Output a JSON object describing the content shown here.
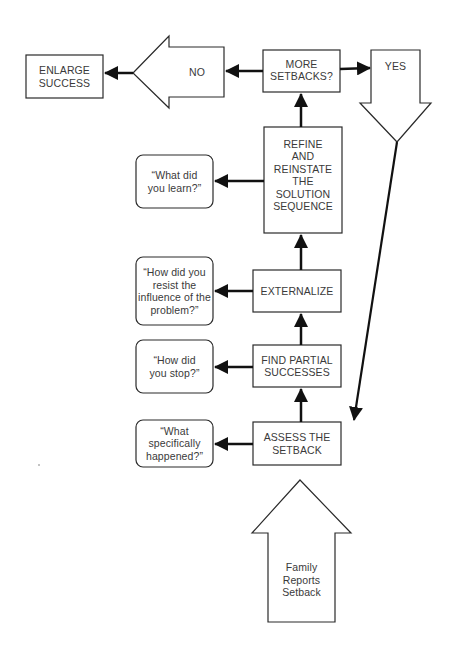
{
  "diagram": {
    "type": "flowchart",
    "nodes": {
      "family_reports": {
        "label": "Family\nReports\nSetback",
        "shape": "up-arrow"
      },
      "assess": {
        "label": "ASSESS THE\nSETBACK",
        "shape": "rectangle"
      },
      "assess_q": {
        "label": "“What\nspecifically\nhappened?”",
        "shape": "rounded-rectangle"
      },
      "find_partial": {
        "label": "FIND PARTIAL\nSUCCESSES",
        "shape": "rectangle"
      },
      "find_partial_q": {
        "label": "“How did\nyou stop?”",
        "shape": "rounded-rectangle"
      },
      "externalize": {
        "label": "EXTERNALIZE",
        "shape": "rectangle"
      },
      "externalize_q": {
        "label": "“How did you\nresist the\ninfluence of the\nproblem?”",
        "shape": "rounded-rectangle"
      },
      "refine": {
        "label": "REFINE\nAND\nREINSTATE\nTHE\nSOLUTION\nSEQUENCE",
        "shape": "rectangle"
      },
      "refine_q": {
        "label": "“What did\nyou learn?”",
        "shape": "rounded-rectangle"
      },
      "more_setbacks": {
        "label": "MORE\nSETBACKS?",
        "shape": "rectangle"
      },
      "yes": {
        "label": "YES",
        "shape": "down-arrow"
      },
      "no": {
        "label": "NO",
        "shape": "left-arrow"
      },
      "enlarge": {
        "label": "ENLARGE\nSUCCESS",
        "shape": "rectangle"
      }
    },
    "edges": [
      {
        "from": "family_reports",
        "to": "assess"
      },
      {
        "from": "assess",
        "to": "assess_q"
      },
      {
        "from": "assess",
        "to": "find_partial"
      },
      {
        "from": "find_partial",
        "to": "find_partial_q"
      },
      {
        "from": "find_partial",
        "to": "externalize"
      },
      {
        "from": "externalize",
        "to": "externalize_q"
      },
      {
        "from": "externalize",
        "to": "refine"
      },
      {
        "from": "refine",
        "to": "refine_q"
      },
      {
        "from": "refine",
        "to": "more_setbacks"
      },
      {
        "from": "more_setbacks",
        "to": "yes"
      },
      {
        "from": "more_setbacks",
        "to": "no"
      },
      {
        "from": "yes",
        "to": "assess"
      },
      {
        "from": "no",
        "to": "enlarge"
      }
    ],
    "colors": {
      "stroke": "#2a2a2a",
      "text": "#3a3a3a",
      "background": "#ffffff"
    }
  }
}
